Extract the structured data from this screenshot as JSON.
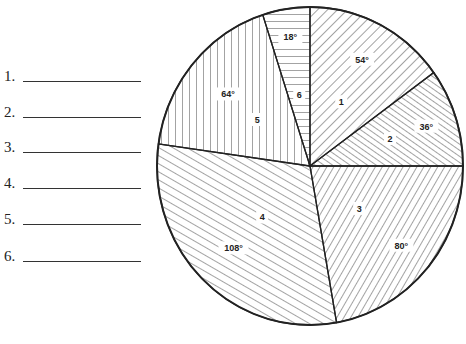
{
  "answers": [
    {
      "num": "1.",
      "value": ""
    },
    {
      "num": "2.",
      "value": ""
    },
    {
      "num": "3.",
      "value": ""
    },
    {
      "num": "4.",
      "value": ""
    },
    {
      "num": "5.",
      "value": ""
    },
    {
      "num": "6.",
      "value": ""
    }
  ],
  "chart_data": {
    "type": "pie",
    "title": "",
    "categories": [
      "1",
      "2",
      "3",
      "4",
      "5",
      "6"
    ],
    "values": [
      54,
      36,
      80,
      108,
      64,
      18
    ],
    "value_labels": [
      "54°",
      "36°",
      "80°",
      "108°",
      "64°",
      "18°"
    ],
    "units": "degrees",
    "start_angle": "12 o'clock, clockwise",
    "fills": [
      "hatch diagonal down-right",
      "hatch diagonal dense",
      "hatch diagonal steep",
      "hatch diagonal shallow",
      "vertical lines",
      "horizontal lines"
    ],
    "legend": "none (numbered answer blanks at left)"
  }
}
